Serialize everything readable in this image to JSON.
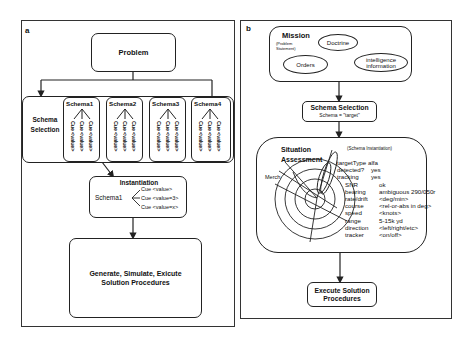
{
  "panel_a": {
    "label": "a",
    "problem": "Problem",
    "schema_selection": {
      "label_line1": "Schema",
      "label_line2": "Selection",
      "schemas": [
        {
          "name": "Schema1",
          "cues": [
            "Cue <value>",
            "Cue <value>",
            "Cue <value>"
          ]
        },
        {
          "name": "Schema2",
          "cues": [
            "Cue <value>",
            "Cue <value>",
            "Cue <value>"
          ]
        },
        {
          "name": "Schema3",
          "cues": [
            "Cue <value>",
            "Cue <value>",
            "Cue <value>"
          ]
        },
        {
          "name": "Schema4",
          "cues": [
            "Cue <value>",
            "Cue <value>",
            "Cue <value>"
          ]
        }
      ]
    },
    "instantiation": {
      "title": "Instantiation",
      "schema": "Schema1",
      "cues": [
        "Cue <value>",
        "Cue <value=3>",
        "Cue <value=x>"
      ]
    },
    "solution": {
      "line1": "Generate, Simulate, Exicute",
      "line2": "Solution Procedures"
    }
  },
  "panel_b": {
    "label": "b",
    "mission": {
      "title": "Mission",
      "subtitle_line1": "(Problem",
      "subtitle_line2": "Statement)",
      "doctrine": "Doctrine",
      "orders": "Orders",
      "intelligence_line1": "intelligence",
      "intelligence_line2": "information"
    },
    "schema_selection": {
      "title": "Schema Selection",
      "value": "Schema = \"target\""
    },
    "situation_assessment": {
      "title_line1": "Situation",
      "title_line2": "Assessment",
      "subtitle": "(Schema Instantiation)",
      "merch_label": "Merch",
      "top_rows": [
        {
          "key": "targetType",
          "value": "alfa"
        },
        {
          "key": "detected?",
          "value": "yes"
        },
        {
          "key": "tracking",
          "value": "yes"
        }
      ],
      "rows": [
        {
          "key": "SNR",
          "value": "ok"
        },
        {
          "key": "bearing",
          "value": "ambiguous 290/050r"
        },
        {
          "key": "rate/drift",
          "value": "<deg/min>"
        },
        {
          "key": "course",
          "value": "<rel-or-abs in deg>"
        },
        {
          "key": "speed",
          "value": "<knots>"
        },
        {
          "key": "range",
          "value": "5-15k yd"
        },
        {
          "key": "direction",
          "value": "<left/right/etc>"
        },
        {
          "key": "tracker",
          "value": "<on/off>"
        }
      ]
    },
    "execute": {
      "line1": "Execute Solution",
      "line2": "Procedures"
    }
  }
}
